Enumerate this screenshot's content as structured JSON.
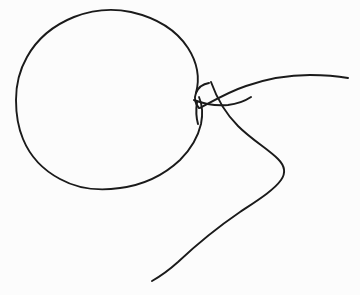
{
  "image": {
    "title": "Balloon with knotted neck and trailing string",
    "subject": "balloon",
    "style": "hand-drawn single-stroke line art",
    "width": 360,
    "height": 295,
    "background_color": "#fcfcfc",
    "ink_color": "#1a1a1a",
    "stroke_width": 1.9,
    "text_present": "none"
  },
  "strokes": {
    "balloon_body": {
      "name": "balloon-body-outline",
      "description": "Large closed rounded blob forming the inflated balloon envelope",
      "bbox": [
        16,
        11,
        221,
        190
      ],
      "path": "M 196 93 C 200 78, 197 62, 188 48 C 177 31, 157 18, 131 12 C 112 8, 92 10, 74 17 C 54 25, 37 39, 27 57 C 19 71, 16 86, 16 100 C 16 113, 18 127, 23 139 C 30 156, 43 170, 60 179 C 78 189, 100 191, 120 188 C 143 185, 164 175, 180 160 C 191 149, 198 137, 201 124 C 203 114, 202 104, 199 97"
    },
    "knot": {
      "name": "balloon-knot",
      "description": "Small tied neck of the balloon, a pinched loop with a short downward stub",
      "bbox": [
        192,
        78,
        42,
        50
      ],
      "paths": [
        {
          "name": "knot-left-hook",
          "path": "M 209 83 C 203 84, 198 88, 196 93 C 194 98, 195 104, 199 108"
        },
        {
          "name": "knot-stub",
          "path": "M 197 102 C 196 109, 196 117, 198 124"
        },
        {
          "name": "knot-cross-band",
          "path": "M 194 100 C 204 104, 216 106, 228 105 C 237 104, 245 101, 251 97"
        }
      ]
    },
    "string_upper": {
      "name": "string-upper-tail",
      "description": "String segment rising from the knot and sweeping right to the right edge, ending in a free tip",
      "bbox": [
        196,
        74,
        152,
        34
      ],
      "path": "M 200 108 C 213 101, 228 92, 246 86 C 266 79, 288 75, 310 75 C 324 75, 337 76, 348 78"
    },
    "string_lower": {
      "name": "string-lower-tail",
      "description": "Long string curving down and right from the knot, looping around and descending to the bottom-left free end",
      "bbox": [
        152,
        82,
        134,
        200
      ],
      "path": "M 211 82 C 216 96, 224 112, 238 126 C 252 140, 268 149, 278 159 C 285 166, 286 173, 281 180 C 274 190, 258 200, 240 212 C 218 227, 195 246, 178 262 C 168 271, 159 277, 152 281"
    }
  },
  "endpoints": [
    {
      "name": "string-upper-free-end",
      "x": 348,
      "y": 78
    },
    {
      "name": "string-lower-free-end",
      "x": 152,
      "y": 281
    },
    {
      "name": "knot-stub-end",
      "x": 198,
      "y": 124
    },
    {
      "name": "knot-hook-start",
      "x": 209,
      "y": 83
    }
  ]
}
